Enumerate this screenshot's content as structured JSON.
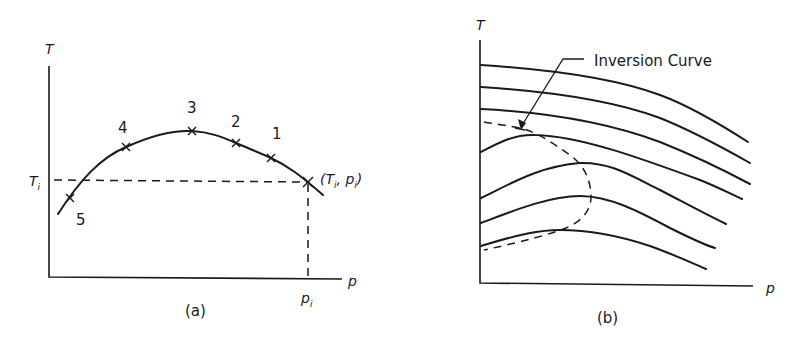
{
  "panel_a": {
    "caption": "(a)",
    "y_axis_label": "T",
    "x_axis_label": "p",
    "ti_label": "T",
    "ti_sub": "i",
    "pi_label": "p",
    "pi_sub": "i",
    "point_label_open": "(T",
    "point_label_sub1": "i",
    "point_label_mid": ", p",
    "point_label_sub2": "i",
    "point_label_close": ")",
    "points": [
      {
        "label": "1"
      },
      {
        "label": "2"
      },
      {
        "label": "3"
      },
      {
        "label": "4"
      },
      {
        "label": "5"
      }
    ]
  },
  "panel_b": {
    "caption": "(b)",
    "y_axis_label": "T",
    "x_axis_label": "p",
    "annotation": "Inversion Curve",
    "isenthalp_count": 7
  },
  "colors": {
    "ink": "#1a1a1a",
    "background": "#ffffff"
  }
}
